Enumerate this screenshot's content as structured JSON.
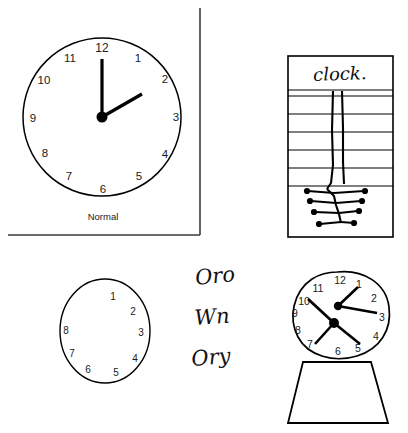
{
  "figure": {
    "title_caption": "Normal",
    "panels": [
      {
        "id": "panel-normal",
        "name": "normal-clock-panel",
        "caption": "Normal",
        "clock": {
          "shape": "circle",
          "numbers": [
            "12",
            "1",
            "2",
            "3",
            "4",
            "5",
            "6",
            "7",
            "8",
            "9",
            "10",
            "11"
          ],
          "hands": [
            {
              "name": "minute-hand",
              "points_to": "12",
              "length": 52
            },
            {
              "name": "hour-hand",
              "points_to": "1-2",
              "length": 44
            }
          ],
          "hub_count": 1
        }
      },
      {
        "id": "panel-writing",
        "name": "clock-word-panel",
        "word": "clock.",
        "ruled_line_count": 7,
        "stem_lines": 2,
        "fishbone": {
          "rows": 4,
          "dots_per_row": 2
        }
      },
      {
        "id": "panel-oval-clock",
        "name": "oval-clock-panel",
        "clock": {
          "shape": "oval",
          "numbers": [
            "1",
            "2",
            "3",
            "4",
            "5",
            "6",
            "7",
            "8"
          ],
          "hands": [],
          "hub_count": 0
        }
      },
      {
        "id": "panel-scribbles",
        "name": "cursive-scribble-panel",
        "lines": [
          "Oro",
          "Wn",
          "Ory"
        ]
      },
      {
        "id": "panel-mantel-clock",
        "name": "mantel-clock-panel",
        "clock": {
          "shape": "irregular-oval",
          "numbers": [
            "12",
            "1",
            "2",
            "3",
            "4",
            "5",
            "6",
            "7",
            "8",
            "9",
            "10",
            "11"
          ],
          "hands": [
            {
              "name": "hand-to-1",
              "points_to": "1"
            },
            {
              "name": "hand-to-3",
              "points_to": "3"
            },
            {
              "name": "hand-to-10",
              "points_to": "10"
            },
            {
              "name": "hand-to-7",
              "points_to": "7"
            },
            {
              "name": "hand-to-5",
              "points_to": "5"
            }
          ],
          "hub_count": 2,
          "base": "trapezoid"
        }
      }
    ],
    "colors": {
      "ink": "#000000",
      "label": "#1a1a1a",
      "background": "#ffffff",
      "divider": "#3a3a3a"
    }
  },
  "numbers": {
    "n1": "1",
    "n2": "2",
    "n3": "3",
    "n4": "4",
    "n5": "5",
    "n6": "6",
    "n7": "7",
    "n8": "8",
    "n9": "9",
    "n10": "10",
    "n11": "11",
    "n12": "12"
  },
  "labels": {
    "normal": "Normal",
    "clock_word": "clock.",
    "scribble1": "Oro",
    "scribble2": "Wn",
    "scribble3": "Ory"
  }
}
